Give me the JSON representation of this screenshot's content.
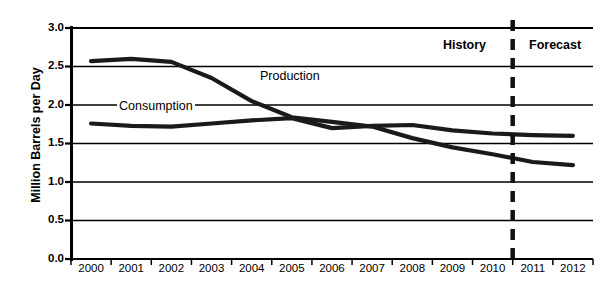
{
  "chart_data": {
    "type": "line",
    "title": "",
    "xlabel": "",
    "ylabel": "Million Barrels per Day",
    "categories": [
      "2000",
      "2001",
      "2002",
      "2003",
      "2004",
      "2005",
      "2006",
      "2007",
      "2008",
      "2009",
      "2010",
      "2011",
      "2012"
    ],
    "x": [
      2000,
      2001,
      2002,
      2003,
      2004,
      2005,
      2006,
      2007,
      2008,
      2009,
      2010,
      2011,
      2012
    ],
    "ylim": [
      0.0,
      3.0
    ],
    "ytick_labels": [
      "3.0",
      "2.5",
      "2.0",
      "1.5",
      "1.0",
      "0.5",
      "0.0"
    ],
    "ytick_values": [
      3.0,
      2.5,
      2.0,
      1.5,
      1.0,
      0.5,
      0.0
    ],
    "grid": "horizontal",
    "legend_position": "inline-annotations",
    "series": [
      {
        "name": "Production",
        "color": "#1a1a1a",
        "values": [
          2.57,
          2.6,
          2.56,
          2.35,
          2.05,
          1.84,
          1.78,
          1.72,
          1.57,
          1.45,
          1.36,
          1.26,
          1.22
        ]
      },
      {
        "name": "Consumption",
        "color": "#1a1a1a",
        "values": [
          1.76,
          1.73,
          1.72,
          1.76,
          1.8,
          1.83,
          1.7,
          1.73,
          1.74,
          1.67,
          1.63,
          1.61,
          1.6
        ]
      }
    ],
    "annotations": [
      {
        "id": "production",
        "text": "Production"
      },
      {
        "id": "consumption",
        "text": "Consumption"
      },
      {
        "id": "history",
        "text": "History"
      },
      {
        "id": "forecast",
        "text": "Forecast"
      }
    ],
    "divider": {
      "label": "history-forecast-divider",
      "at_x": 2010.5,
      "style": "dashed"
    }
  }
}
